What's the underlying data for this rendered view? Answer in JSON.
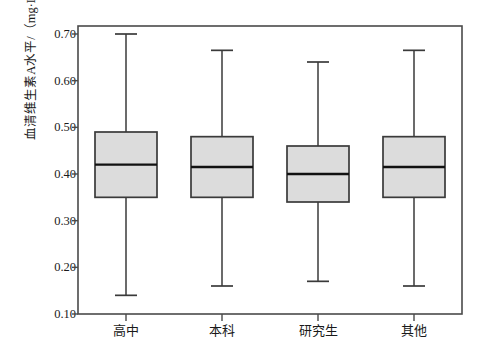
{
  "chart_data": {
    "type": "box",
    "title": "",
    "xlabel": "",
    "ylabel": "血清维生素A水平/（mg·L⁻¹）",
    "ylabel_plain": "血清维生素A水平/ ( mg · L-1 )",
    "categories": [
      "高中",
      "本科",
      "研究生",
      "其他"
    ],
    "ylim": [
      0.1,
      0.7
    ],
    "ytick_values": [
      0.7,
      0.6,
      0.5,
      0.4,
      0.3,
      0.2,
      0.1
    ],
    "ytick_labels": [
      "0.70",
      "0.60",
      "0.50",
      "0.40",
      "0.30",
      "0.20",
      "0.10"
    ],
    "grid": false,
    "legend": "none",
    "box_fill_color": "#dcdcdc",
    "box_edge_color": "#3a3a3a",
    "axis_color": "#4a4a4a",
    "boxes": [
      {
        "category": "高中",
        "whisker_low": 0.14,
        "q1": 0.35,
        "median": 0.42,
        "q3": 0.49,
        "whisker_high": 0.7
      },
      {
        "category": "本科",
        "whisker_low": 0.16,
        "q1": 0.35,
        "median": 0.415,
        "q3": 0.48,
        "whisker_high": 0.665
      },
      {
        "category": "研究生",
        "whisker_low": 0.17,
        "q1": 0.34,
        "median": 0.4,
        "q3": 0.46,
        "whisker_high": 0.64
      },
      {
        "category": "其他",
        "whisker_low": 0.16,
        "q1": 0.35,
        "median": 0.415,
        "q3": 0.48,
        "whisker_high": 0.665
      }
    ]
  }
}
